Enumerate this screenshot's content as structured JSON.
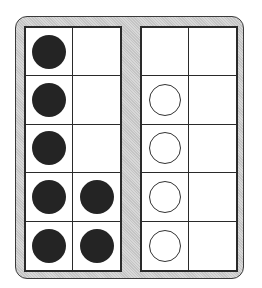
{
  "diagram": {
    "colors": {
      "frame_background": "#cfcfcf",
      "grid_line": "#2a2a2a",
      "filled_counter": "#242424",
      "empty_counter_stroke": "#333333"
    },
    "frames": [
      {
        "name": "left-ten-frame",
        "cells": [
          [
            "filled",
            "none"
          ],
          [
            "filled",
            "none"
          ],
          [
            "filled",
            "none"
          ],
          [
            "filled",
            "filled"
          ],
          [
            "filled",
            "filled"
          ]
        ],
        "filled_count": 7,
        "empty_count": 0
      },
      {
        "name": "right-ten-frame",
        "cells": [
          [
            "none",
            "none"
          ],
          [
            "empty",
            "none"
          ],
          [
            "empty",
            "none"
          ],
          [
            "empty",
            "none"
          ],
          [
            "empty",
            "none"
          ]
        ],
        "filled_count": 0,
        "empty_count": 4
      }
    ]
  }
}
